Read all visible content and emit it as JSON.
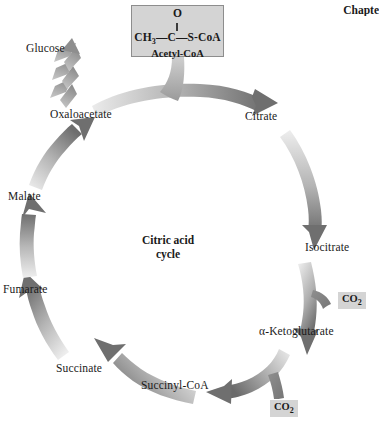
{
  "header": {
    "chapter_label": "Chapte"
  },
  "diagram": {
    "center_title_line1": "Citric acid",
    "center_title_line2": "cycle",
    "acetyl_box": {
      "oxygen_label": "O",
      "chain_left": "CH",
      "chain_left_sub": "3",
      "chain_mid": "C",
      "chain_right": "S-CoA",
      "chain_dash": "—",
      "name_label": "Acetyl-CoA"
    },
    "cycle_labels": [
      {
        "id": "citrate",
        "label": "Citrate"
      },
      {
        "id": "isocitrate",
        "label": "Isocitrate"
      },
      {
        "id": "alpha-ketoglutarate",
        "label": "α-Ketoglutarate"
      },
      {
        "id": "succinyl-coa",
        "label": "Succinyl-CoA"
      },
      {
        "id": "succinate",
        "label": "Succinate"
      },
      {
        "id": "fumarate",
        "label": "Fumarate"
      },
      {
        "id": "malate",
        "label": "Malate"
      },
      {
        "id": "oxaloacetate",
        "label": "Oxaloacetate"
      },
      {
        "id": "glucose",
        "label": "Glucose"
      }
    ],
    "byproducts": [
      {
        "id": "co2-isocitrate",
        "label": "CO",
        "sub": "2"
      },
      {
        "id": "co2-succinyl",
        "label": "CO",
        "sub": "2"
      }
    ],
    "colors": {
      "arrow_dark": "#6f6f6f",
      "arrow_light": "#e2e2e2",
      "box_fill": "#d4d4d4",
      "box_border": "#8d8d8d",
      "text": "#1a1a1a"
    }
  }
}
